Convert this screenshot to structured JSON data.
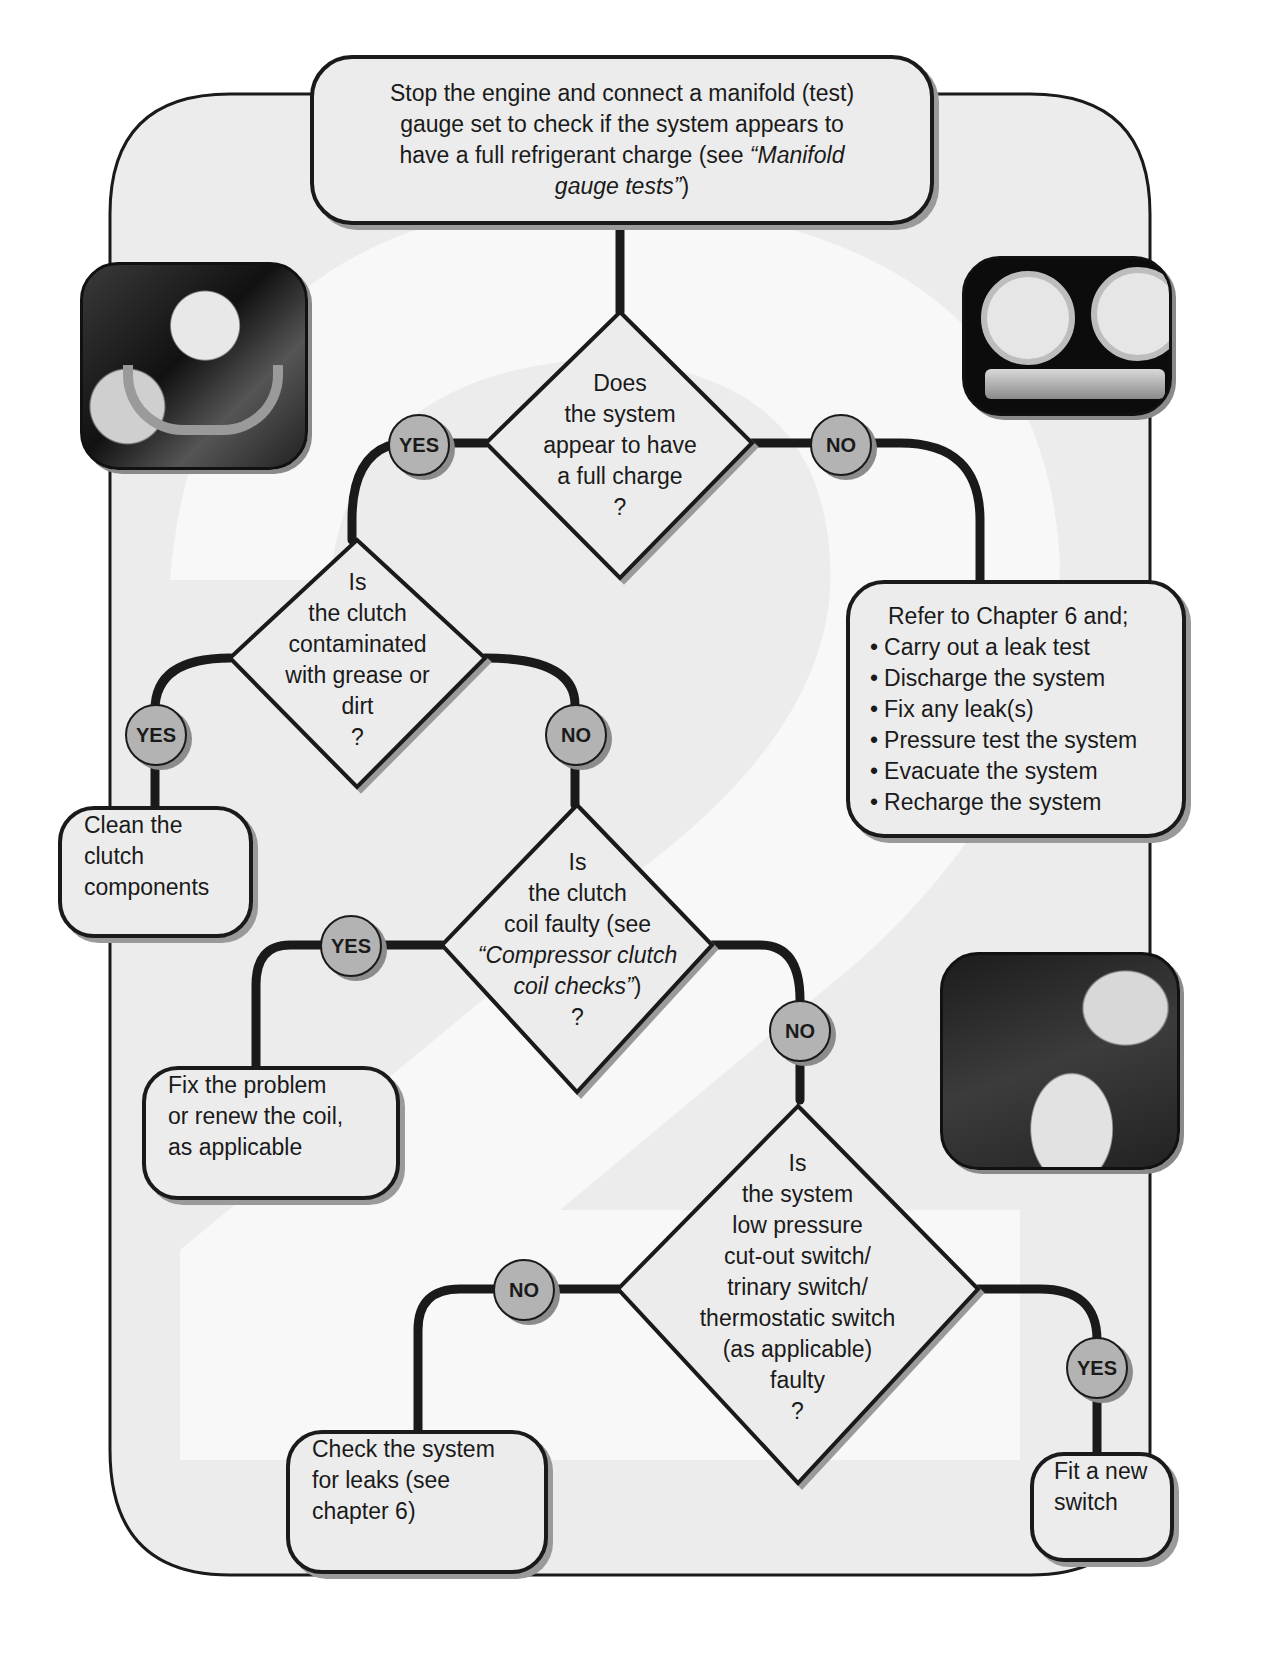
{
  "colors": {
    "panel_fill": "#ececec",
    "node_fill": "#ececec",
    "badge_fill": "#b3b3b3",
    "line": "#1a1a1a",
    "watermark": "#f7f7f7"
  },
  "watermark": {
    "glyph": "2"
  },
  "start": {
    "line1": "Stop the engine and connect a manifold (test)",
    "line2": "gauge set to check if the system appears to",
    "line3a": "have a full refrigerant charge (see ",
    "line3b": "“Manifold",
    "line4a": "gauge tests”",
    "line4b": ")"
  },
  "decisions": {
    "full_charge": {
      "lines": [
        "Does",
        "the system",
        "appear to have",
        "a full charge",
        "?"
      ]
    },
    "contaminated": {
      "lines": [
        "Is",
        "the clutch",
        "contaminated",
        "with grease or",
        "dirt",
        "?"
      ]
    },
    "coil_faulty": {
      "line1": "Is",
      "line2": "the clutch",
      "line3": "coil faulty (see",
      "line4": "“Compressor clutch",
      "line5a": "coil checks”",
      "line5b": ")",
      "line6": "?"
    },
    "switch_faulty": {
      "lines": [
        "Is",
        "the system",
        "low pressure",
        "cut-out switch/",
        "trinary switch/",
        "thermostatic switch",
        "(as applicable)",
        "faulty",
        "?"
      ]
    }
  },
  "actions": {
    "leak_procedure": {
      "heading": "Refer to Chapter 6 and;",
      "bullets": [
        "Carry out a leak test",
        "Discharge the system",
        "Fix any leak(s)",
        "Pressure test the system",
        "Evacuate the system",
        "Recharge the system"
      ]
    },
    "clean_clutch": {
      "lines": [
        "Clean the",
        "clutch",
        "components"
      ]
    },
    "fix_coil": {
      "lines": [
        "Fix the problem",
        "or renew the coil,",
        "as applicable"
      ]
    },
    "check_leaks": {
      "lines": [
        "Check the system",
        "for leaks (see",
        "chapter 6)"
      ]
    },
    "new_switch": {
      "lines": [
        "Fit a new",
        "switch"
      ]
    }
  },
  "badges": {
    "q1_yes": "YES",
    "q1_no": "NO",
    "q2_yes": "YES",
    "q2_no": "NO",
    "q3_yes": "YES",
    "q3_no": "NO",
    "q4_no": "NO",
    "q4_yes": "YES"
  },
  "photos": {
    "top_left": "gloved hands connecting a hose coupling",
    "top_right": "manifold gauge set with two dial gauges",
    "right": "technician working on engine bay"
  }
}
